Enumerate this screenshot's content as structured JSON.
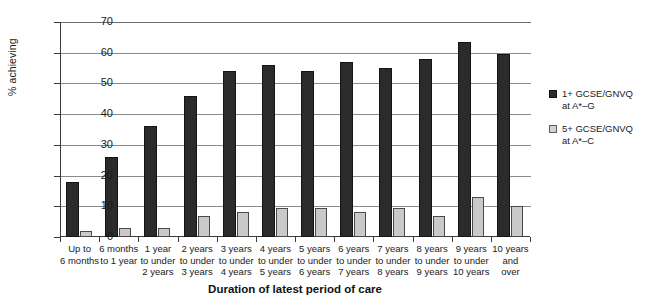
{
  "chart_data": {
    "type": "bar",
    "title": "",
    "xlabel": "Duration of latest period of care",
    "ylabel": "% achieving",
    "ylim": [
      0,
      70
    ],
    "yticks": [
      0,
      10,
      20,
      30,
      40,
      50,
      60,
      70
    ],
    "grid": true,
    "legend_position": "right",
    "categories": [
      "Up to 6 months",
      "6 months to 1 year",
      "1 year to under 2 years",
      "2 years to under 3 years",
      "3 years to under 4 years",
      "4 years to under 5 years",
      "5 years to under 6 years",
      "6 years to under 7 years",
      "7 years to under 8 years",
      "8 years to under 9 years",
      "9 years to under 10 years",
      "10 years and over"
    ],
    "category_lines": [
      [
        "Up to",
        "6 months"
      ],
      [
        "6 months",
        "to 1 year"
      ],
      [
        "1 year",
        "to under",
        "2 years"
      ],
      [
        "2 years",
        "to under",
        "3 years"
      ],
      [
        "3 years",
        "to under",
        "4 years"
      ],
      [
        "4 years",
        "to under",
        "5 years"
      ],
      [
        "5 years",
        "to under",
        "6 years"
      ],
      [
        "6 years",
        "to under",
        "7 years"
      ],
      [
        "7 years",
        "to under",
        "8 years"
      ],
      [
        "8 years",
        "to under",
        "9 years"
      ],
      [
        "9 years",
        "to under",
        "10 years"
      ],
      [
        "10 years",
        "and",
        "over"
      ]
    ],
    "series": [
      {
        "name": "1+ GCSE/GNVQ at A*–G",
        "name_lines": [
          "1+ GCSE/GNVQ",
          "at A*–G"
        ],
        "color": "#2b2b2b",
        "values": [
          18,
          26,
          36,
          46,
          54,
          56,
          54,
          57,
          55,
          58,
          63.5,
          59.5
        ]
      },
      {
        "name": "5+ GCSE/GNVQ at A*–C",
        "name_lines": [
          "5+ GCSE/GNVQ",
          "at A*–C"
        ],
        "color": "#c9c9c9",
        "values": [
          2,
          3,
          3,
          7,
          8,
          9.5,
          9.5,
          8,
          9.5,
          7,
          13,
          10
        ]
      }
    ]
  }
}
